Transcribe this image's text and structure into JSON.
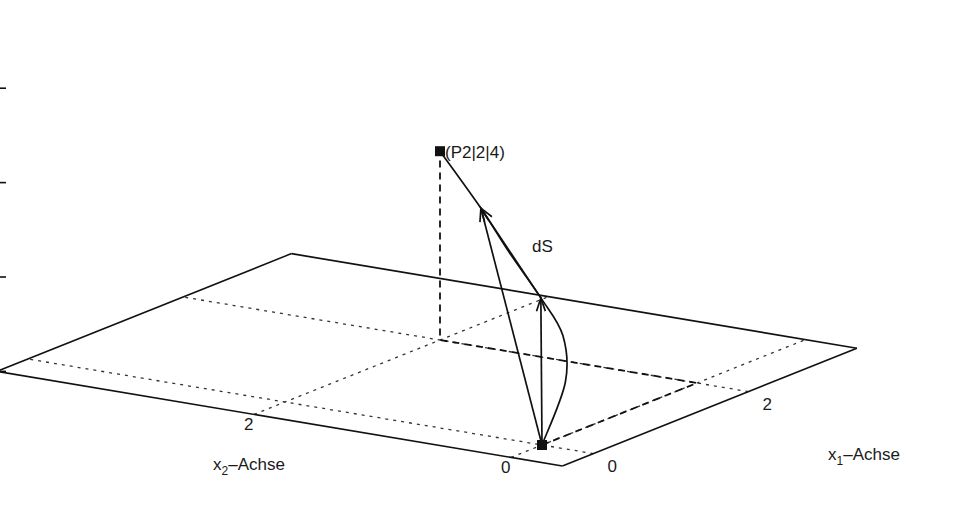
{
  "chart_data": {
    "type": "line",
    "title": "",
    "projection": "3d",
    "z_axis": {
      "ticks": [
        0,
        2,
        4,
        6,
        8
      ],
      "tick_labels": [
        "0",
        "2",
        "4",
        "6",
        "8"
      ],
      "range": [
        0,
        8
      ]
    },
    "x1_axis": {
      "label_main": "x",
      "label_sub": "1",
      "label_rest": "–Achse",
      "ticks": [
        0,
        2
      ],
      "tick_labels": [
        "0",
        "2"
      ],
      "range": [
        -0.4,
        3.4
      ]
    },
    "x2_axis": {
      "label_main": "x",
      "label_sub": "2",
      "label_rest": "–Achse",
      "ticks": [
        0,
        2
      ],
      "tick_labels": [
        "0",
        "2"
      ],
      "range": [
        -0.4,
        4.0
      ]
    },
    "points": [
      {
        "name": "start",
        "x1": 0,
        "x2": 0,
        "z": 0,
        "label": ""
      },
      {
        "name": "P2",
        "x1": 2,
        "x2": 2,
        "z": 4,
        "label": "(P2|2|4)"
      }
    ],
    "curve": {
      "description": "path from origin up to P2",
      "points": [
        [
          0,
          0,
          0
        ],
        [
          0.55,
          0.15,
          0.9
        ],
        [
          0.85,
          0.35,
          1.6
        ],
        [
          0.98,
          0.6,
          2.2
        ],
        [
          1.15,
          0.95,
          2.9
        ],
        [
          1.45,
          1.35,
          3.45
        ],
        [
          2,
          2,
          4
        ]
      ]
    },
    "vectors": [
      {
        "from": [
          0,
          0,
          0
        ],
        "to": [
          0.98,
          0.6,
          2.2
        ]
      },
      {
        "from": [
          0,
          0,
          0
        ],
        "to": [
          1.45,
          1.35,
          3.45
        ]
      },
      {
        "from": [
          0.98,
          0.6,
          2.2
        ],
        "to": [
          1.45,
          1.35,
          3.45
        ]
      }
    ],
    "annotations": [
      {
        "text": "dS",
        "near": [
          1.45,
          1.35,
          3.45
        ]
      }
    ],
    "projection_lines": [
      {
        "style": "dashed",
        "path": [
          [
            0,
            0,
            0
          ],
          [
            2,
            0,
            0
          ],
          [
            2,
            2,
            0
          ],
          [
            2,
            2,
            4
          ]
        ]
      }
    ],
    "grid": true
  }
}
